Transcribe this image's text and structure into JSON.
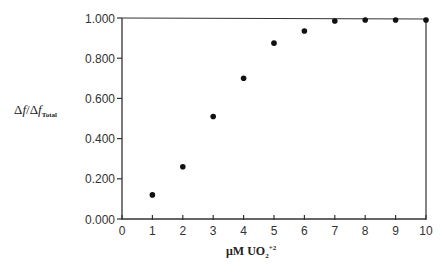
{
  "chart_data": {
    "type": "scatter",
    "title": "",
    "xlabel": "μM UO2+2",
    "ylabel": "Δf/Δf_Total",
    "xlim": [
      0,
      10
    ],
    "ylim": [
      0.0,
      1.0
    ],
    "x_ticks": [
      "0",
      "1",
      "2",
      "3",
      "4",
      "5",
      "6",
      "7",
      "8",
      "9",
      "10"
    ],
    "y_ticks": [
      "0.000",
      "0.200",
      "0.400",
      "0.600",
      "0.800",
      "1.000"
    ],
    "grid": false,
    "legend": null,
    "series": [
      {
        "name": "Δf/Δf_Total",
        "x": [
          1,
          2,
          3,
          4,
          5,
          6,
          7,
          8,
          9,
          10
        ],
        "y": [
          0.12,
          0.26,
          0.51,
          0.7,
          0.875,
          0.935,
          0.985,
          0.99,
          0.99,
          0.99
        ]
      }
    ],
    "colors": {
      "axis": "#333333",
      "marker": "#111111"
    }
  },
  "labels": {
    "y_delta1": "Δ",
    "y_f1": "f",
    "y_slash": "/",
    "y_delta2": "Δ",
    "y_f2": "f",
    "y_sub": "Total",
    "x_main": "μM  UO",
    "x_sub": "2",
    "x_sup": "+2"
  }
}
